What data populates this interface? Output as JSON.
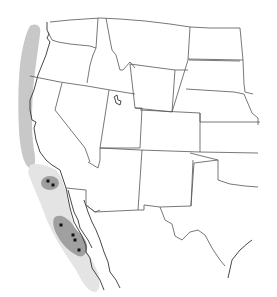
{
  "map": {
    "title": "",
    "region": "Western United States and Baja California",
    "colors": {
      "background": "#ffffff",
      "state_borders": "#555555",
      "range_light": "#e6e6e6",
      "range_medium": "#c4c4c4",
      "range_dark": "#9e9e9e",
      "points": "#111111"
    },
    "shaded_regions": [
      {
        "name": "northern-coastal-band",
        "shade": "medium"
      },
      {
        "name": "southern-coastal-band",
        "shade": "light"
      },
      {
        "name": "southern-california-cluster",
        "shade": "dark"
      },
      {
        "name": "baja-cluster",
        "shade": "dark"
      }
    ],
    "points": [
      {
        "x": 48,
        "y": 181
      },
      {
        "x": 53,
        "y": 185
      },
      {
        "x": 61,
        "y": 225
      },
      {
        "x": 73,
        "y": 235
      },
      {
        "x": 75,
        "y": 240
      },
      {
        "x": 79,
        "y": 250
      }
    ]
  }
}
